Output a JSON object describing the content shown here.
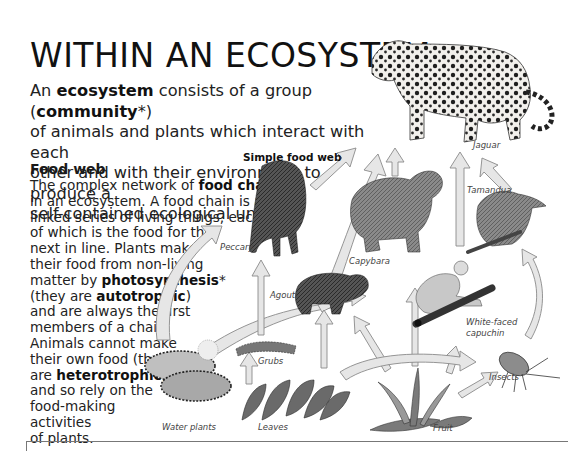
{
  "page": {
    "title": "WITHIN AN ECOSYSTEM",
    "intro": {
      "lines": [
        [
          "An ",
          {
            "b": "ecosystem"
          },
          " consists of a group (",
          {
            "b": "community"
          },
          "*)"
        ],
        [
          "of animals and plants which interact with each"
        ],
        [
          "other and with their environment to produce a"
        ],
        [
          "self-contained ecological unit."
        ]
      ]
    }
  },
  "food_web_section": {
    "heading": "Food web",
    "lines": [
      [
        "The complex network of ",
        {
          "b": "food chains"
        }
      ],
      [
        "in an ecosystem. A food chain is a"
      ],
      [
        "linked series of living things, each"
      ],
      [
        "of which is the food for the"
      ],
      [
        "next in line. Plants make"
      ],
      [
        "their food from non-living"
      ],
      [
        "matter by ",
        {
          "b": "photosynthesis"
        },
        "*"
      ],
      [
        "(they are ",
        {
          "b": "autotrophic"
        },
        ")"
      ],
      [
        "and are always the first"
      ],
      [
        "members of a chain."
      ],
      [
        "Animals cannot make"
      ],
      [
        "their own food (they"
      ],
      [
        "are ",
        {
          "b": "heterotrophic"
        },
        ")"
      ],
      [
        "and so rely on the"
      ],
      [
        "food-making"
      ],
      [
        "activities"
      ],
      [
        "of plants."
      ]
    ]
  },
  "diagram": {
    "title": "Simple food web",
    "labels": {
      "jaguar": "Jaguar",
      "tamandua": "Tamandua",
      "peccary": "Peccary",
      "capybara": "Capybara",
      "agouti": "Agouti",
      "capuchin_line1": "White-faced",
      "capuchin_line2": "capuchin",
      "grubs": "Grubs",
      "insects": "Insects",
      "water_plants": "Water plants",
      "leaves": "Leaves",
      "fruit": "Fruit"
    },
    "colors": {
      "arrow_fill": "#e6e6e6",
      "arrow_stroke": "#8a8a8a",
      "animal_dark": "#3a3a3a",
      "plant_dark": "#4a4a4a"
    }
  }
}
